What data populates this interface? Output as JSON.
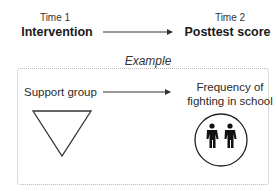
{
  "top": {
    "left": {
      "time": "Time 1",
      "label": "Intervention"
    },
    "right": {
      "time": "Time 2",
      "label": "Posttest score"
    }
  },
  "example": {
    "title": "Example",
    "left_label": "Support group",
    "right_label_line1": "Frequency of",
    "right_label_line2": "fighting in school",
    "left_icon": "inverted-triangle-icon",
    "right_icon": "two-people-in-circle-icon"
  },
  "colors": {
    "stroke": "#333333",
    "border": "#b5b5b5",
    "background": "#ffffff"
  }
}
